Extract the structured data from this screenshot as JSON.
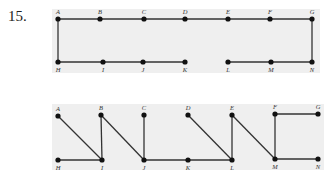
{
  "problem_number": "15.",
  "colors": {
    "panel": "#efefef",
    "edge": "#333333",
    "node": "#111111",
    "label": "#333333"
  },
  "diagrams": [
    {
      "name": "top-graph",
      "panel": {
        "x": 52,
        "y": 9,
        "w": 268,
        "h": 64
      },
      "nodes": [
        {
          "id": "A",
          "x": 58,
          "y": 19,
          "pos": "top"
        },
        {
          "id": "B",
          "x": 100,
          "y": 19,
          "pos": "top"
        },
        {
          "id": "C",
          "x": 144,
          "y": 19,
          "pos": "top"
        },
        {
          "id": "D",
          "x": 185,
          "y": 19,
          "pos": "top"
        },
        {
          "id": "E",
          "x": 228,
          "y": 19,
          "pos": "top"
        },
        {
          "id": "F",
          "x": 270,
          "y": 19,
          "pos": "top"
        },
        {
          "id": "G",
          "x": 312,
          "y": 19,
          "pos": "top"
        },
        {
          "id": "H",
          "x": 58,
          "y": 62,
          "pos": "bottom"
        },
        {
          "id": "I",
          "x": 103,
          "y": 62,
          "pos": "bottom"
        },
        {
          "id": "J",
          "x": 143,
          "y": 62,
          "pos": "bottom"
        },
        {
          "id": "K",
          "x": 185,
          "y": 62,
          "pos": "bottom"
        },
        {
          "id": "L",
          "x": 228,
          "y": 62,
          "pos": "bottom"
        },
        {
          "id": "M",
          "x": 271,
          "y": 62,
          "pos": "bottom"
        },
        {
          "id": "N",
          "x": 312,
          "y": 62,
          "pos": "bottom"
        }
      ],
      "edges": [
        [
          "A",
          "B"
        ],
        [
          "B",
          "C"
        ],
        [
          "C",
          "D"
        ],
        [
          "D",
          "E"
        ],
        [
          "E",
          "F"
        ],
        [
          "F",
          "G"
        ],
        [
          "G",
          "N"
        ],
        [
          "N",
          "M"
        ],
        [
          "M",
          "L"
        ],
        [
          "A",
          "H"
        ],
        [
          "H",
          "I"
        ],
        [
          "I",
          "J"
        ],
        [
          "J",
          "K"
        ]
      ]
    },
    {
      "name": "bottom-graph",
      "panel": {
        "x": 52,
        "y": 104,
        "w": 272,
        "h": 66
      },
      "nodes": [
        {
          "id": "A",
          "x": 58,
          "y": 116,
          "pos": "top"
        },
        {
          "id": "B",
          "x": 101,
          "y": 115,
          "pos": "top"
        },
        {
          "id": "C",
          "x": 144,
          "y": 115,
          "pos": "top"
        },
        {
          "id": "D",
          "x": 188,
          "y": 115,
          "pos": "top"
        },
        {
          "id": "E",
          "x": 232,
          "y": 115,
          "pos": "top"
        },
        {
          "id": "F",
          "x": 275,
          "y": 114,
          "pos": "top"
        },
        {
          "id": "G",
          "x": 318,
          "y": 114,
          "pos": "top"
        },
        {
          "id": "H",
          "x": 58,
          "y": 160,
          "pos": "bottom"
        },
        {
          "id": "I",
          "x": 102,
          "y": 160,
          "pos": "bottom"
        },
        {
          "id": "J",
          "x": 144,
          "y": 160,
          "pos": "bottom"
        },
        {
          "id": "K",
          "x": 188,
          "y": 160,
          "pos": "bottom"
        },
        {
          "id": "L",
          "x": 232,
          "y": 160,
          "pos": "bottom"
        },
        {
          "id": "M",
          "x": 275,
          "y": 159,
          "pos": "bottom"
        },
        {
          "id": "N",
          "x": 318,
          "y": 159,
          "pos": "bottom"
        }
      ],
      "edges": [
        [
          "A",
          "I"
        ],
        [
          "H",
          "I"
        ],
        [
          "B",
          "I"
        ],
        [
          "B",
          "J"
        ],
        [
          "C",
          "J"
        ],
        [
          "J",
          "K"
        ],
        [
          "K",
          "L"
        ],
        [
          "D",
          "L"
        ],
        [
          "E",
          "L"
        ],
        [
          "E",
          "M"
        ],
        [
          "F",
          "M"
        ],
        [
          "F",
          "G"
        ],
        [
          "M",
          "N"
        ]
      ]
    }
  ]
}
